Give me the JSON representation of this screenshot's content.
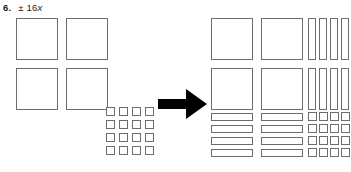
{
  "problem": {
    "number": "6.",
    "expression_prefix": "± 16",
    "expression_variable": "x",
    "expression_full": "± 16x"
  },
  "colors": {
    "tile_outline": "#6d6d6d",
    "arrow_fill": "#000000",
    "text": "#1b1b1b",
    "background": "#ffffff"
  },
  "arrow": {
    "icon": "right-arrow-icon",
    "direction": "right"
  },
  "diagram": {
    "type": "algebra-tiles",
    "left_side": {
      "label": "unfactored-tiles",
      "groups": [
        {
          "name": "large-squares",
          "tile_type": "x-squared",
          "rows": 2,
          "cols": 2,
          "count": 4
        },
        {
          "name": "unit-squares",
          "tile_type": "unit",
          "rows": 4,
          "cols": 4,
          "count": 16
        }
      ]
    },
    "right_side": {
      "label": "factored-array",
      "groups": [
        {
          "name": "large-squares",
          "tile_type": "x-squared",
          "rows": 2,
          "cols": 2,
          "count": 4
        },
        {
          "name": "vertical-bars",
          "tile_type": "x",
          "rows": 2,
          "cols": 4,
          "count": 8
        },
        {
          "name": "horizontal-bars",
          "tile_type": "x",
          "rows": 4,
          "cols": 2,
          "count": 8
        },
        {
          "name": "unit-squares",
          "tile_type": "unit",
          "rows": 4,
          "cols": 4,
          "count": 16
        }
      ]
    }
  }
}
